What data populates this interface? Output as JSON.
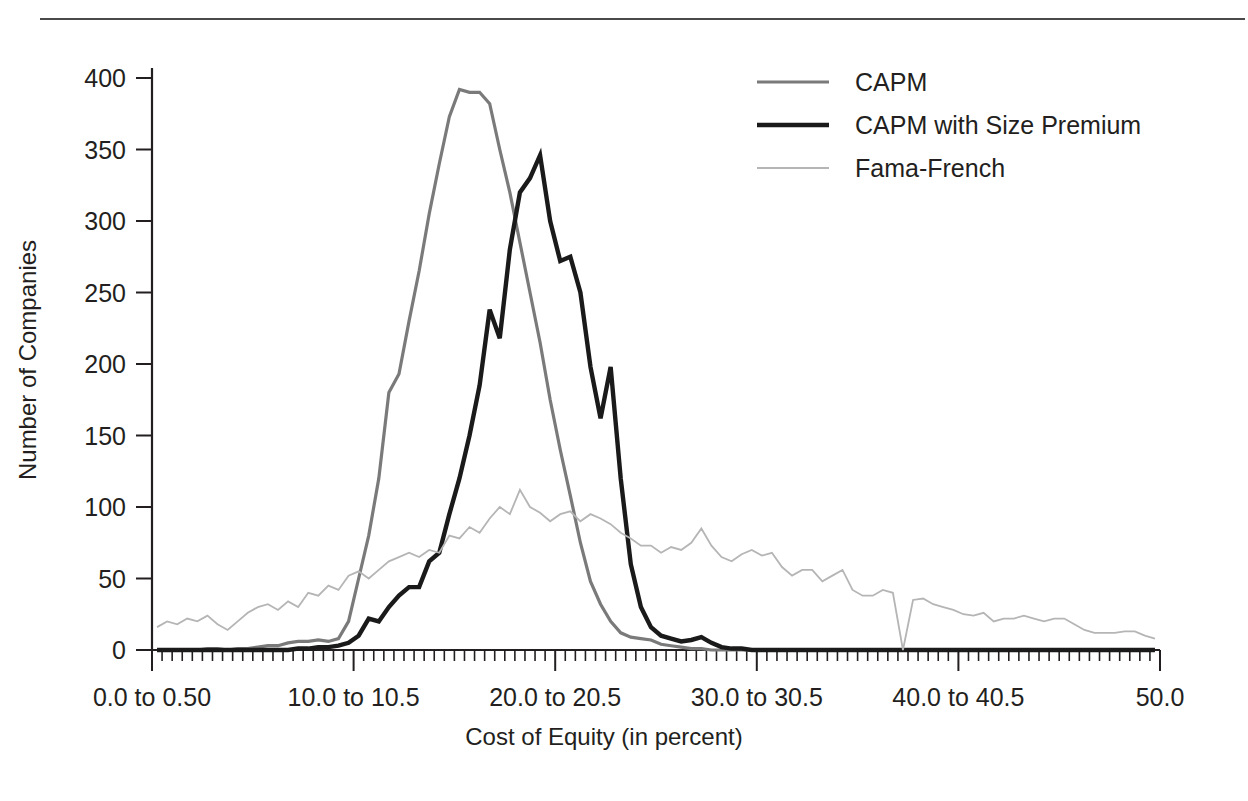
{
  "chart_data": {
    "type": "line",
    "title": "",
    "xlabel": "Cost of Equity (in percent)",
    "ylabel": "Number of Companies",
    "xlim": [
      0,
      50
    ],
    "ylim": [
      0,
      400
    ],
    "grid": false,
    "legend_position": "top-right",
    "x_tick_labels": [
      "0.0 to 0.50",
      "10.0 to 10.5",
      "20.0 to 20.5",
      "30.0 to 30.5",
      "40.0 to 40.5",
      "50.0"
    ],
    "x_tick_values": [
      0,
      10,
      20,
      30,
      40,
      50
    ],
    "x_minor_tick_step": 1,
    "y_tick_labels": [
      "0",
      "50",
      "100",
      "150",
      "200",
      "250",
      "300",
      "350",
      "400"
    ],
    "y_tick_values": [
      0,
      50,
      100,
      150,
      200,
      250,
      300,
      350,
      400
    ],
    "bin_width": 0.5,
    "x": [
      0.25,
      0.75,
      1.25,
      1.75,
      2.25,
      2.75,
      3.25,
      3.75,
      4.25,
      4.75,
      5.25,
      5.75,
      6.25,
      6.75,
      7.25,
      7.75,
      8.25,
      8.75,
      9.25,
      9.75,
      10.25,
      10.75,
      11.25,
      11.75,
      12.25,
      12.75,
      13.25,
      13.75,
      14.25,
      14.75,
      15.25,
      15.75,
      16.25,
      16.75,
      17.25,
      17.75,
      18.25,
      18.75,
      19.25,
      19.75,
      20.25,
      20.75,
      21.25,
      21.75,
      22.25,
      22.75,
      23.25,
      23.75,
      24.25,
      24.75,
      25.25,
      25.75,
      26.25,
      26.75,
      27.25,
      27.75,
      28.25,
      28.75,
      29.25,
      29.75,
      30.25,
      30.75,
      31.25,
      31.75,
      32.25,
      32.75,
      33.25,
      33.75,
      34.25,
      34.75,
      35.25,
      35.75,
      36.25,
      36.75,
      37.25,
      37.75,
      38.25,
      38.75,
      39.25,
      39.75,
      40.25,
      40.75,
      41.25,
      41.75,
      42.25,
      42.75,
      43.25,
      43.75,
      44.25,
      44.75,
      45.25,
      45.75,
      46.25,
      46.75,
      47.25,
      47.75,
      48.25,
      48.75,
      49.25,
      49.75
    ],
    "series": [
      {
        "name": "CAPM",
        "color": "#7a7a7a",
        "width": 3.2,
        "values": [
          0,
          0,
          0,
          0,
          0,
          1,
          1,
          0,
          1,
          1,
          2,
          3,
          3,
          5,
          6,
          6,
          7,
          6,
          8,
          20,
          50,
          80,
          120,
          180,
          193,
          230,
          265,
          305,
          340,
          373,
          392,
          390,
          390,
          382,
          350,
          320,
          285,
          250,
          215,
          175,
          140,
          108,
          75,
          48,
          32,
          20,
          12,
          9,
          8,
          7,
          4,
          3,
          2,
          1,
          1,
          0,
          0,
          0,
          0,
          0,
          0,
          0,
          0,
          0,
          0,
          0,
          0,
          0,
          0,
          0,
          0,
          0,
          0,
          0,
          0,
          0,
          0,
          0,
          0,
          0,
          0,
          0,
          0,
          0,
          0,
          0,
          0,
          0,
          0,
          0,
          0,
          0,
          0,
          0,
          0,
          0,
          0,
          0,
          0,
          0
        ]
      },
      {
        "name": "CAPM with Size Premium",
        "color": "#1a1a1a",
        "width": 4.4,
        "values": [
          0,
          0,
          0,
          0,
          0,
          0,
          0,
          0,
          0,
          0,
          0,
          0,
          0,
          0,
          1,
          1,
          2,
          2,
          3,
          5,
          10,
          22,
          20,
          30,
          38,
          44,
          44,
          62,
          68,
          95,
          120,
          150,
          185,
          238,
          218,
          280,
          320,
          330,
          346,
          300,
          272,
          275,
          250,
          198,
          162,
          198,
          120,
          60,
          30,
          16,
          10,
          8,
          6,
          7,
          9,
          5,
          2,
          1,
          1,
          0,
          0,
          0,
          0,
          0,
          0,
          0,
          0,
          0,
          0,
          0,
          0,
          0,
          0,
          0,
          0,
          0,
          0,
          0,
          0,
          0,
          0,
          0,
          0,
          0,
          0,
          0,
          0,
          0,
          0,
          0,
          0,
          0,
          0,
          0,
          0,
          0,
          0,
          0,
          0,
          0
        ]
      },
      {
        "name": "Fama-French",
        "color": "#b5b5b5",
        "width": 1.8,
        "values": [
          16,
          20,
          18,
          22,
          20,
          24,
          18,
          14,
          20,
          26,
          30,
          32,
          28,
          34,
          30,
          40,
          38,
          45,
          42,
          52,
          55,
          50,
          56,
          62,
          65,
          68,
          65,
          70,
          68,
          80,
          78,
          86,
          82,
          92,
          100,
          95,
          112,
          100,
          96,
          90,
          95,
          97,
          90,
          95,
          92,
          88,
          82,
          78,
          73,
          73,
          68,
          72,
          70,
          75,
          85,
          73,
          65,
          62,
          67,
          70,
          66,
          68,
          58,
          52,
          56,
          56,
          48,
          52,
          56,
          42,
          38,
          38,
          42,
          40,
          0,
          35,
          36,
          32,
          30,
          28,
          25,
          24,
          26,
          20,
          22,
          22,
          24,
          22,
          20,
          22,
          22,
          18,
          14,
          12,
          12,
          12,
          13,
          13,
          10,
          8
        ]
      }
    ]
  },
  "legend": {
    "items": [
      {
        "label": "CAPM"
      },
      {
        "label": "CAPM with Size Premium"
      },
      {
        "label": "Fama-French"
      }
    ]
  }
}
